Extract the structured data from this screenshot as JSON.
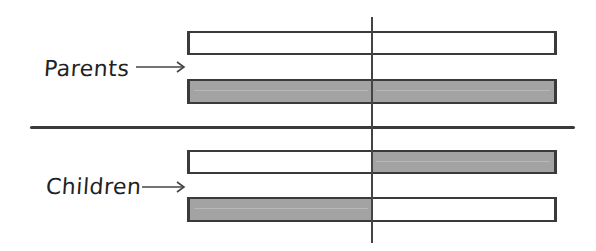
{
  "diagram": {
    "groups": [
      {
        "label": "Parents",
        "bars": [
          {
            "left_fill": "empty",
            "right_fill": "empty"
          },
          {
            "left_fill": "filled",
            "right_fill": "filled"
          }
        ]
      },
      {
        "label": "Children",
        "bars": [
          {
            "left_fill": "empty",
            "right_fill": "filled"
          },
          {
            "left_fill": "filled",
            "right_fill": "empty"
          }
        ]
      }
    ],
    "colors": {
      "fill": "#a3a3a3",
      "outline": "#3a3a3a",
      "background": "#ffffff"
    }
  }
}
